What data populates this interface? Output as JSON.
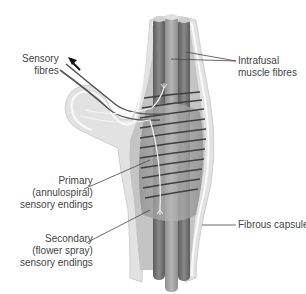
{
  "diagram": {
    "colors": {
      "capsule_outer": "#e2e2e2",
      "capsule_outline": "#f8f8f8",
      "capsule_inner": "#bdbdbd",
      "fibre_dark": "#6a6a6a",
      "fibre_mid": "#8c8c8c",
      "fibre_light": "#a4a4a4",
      "spiral": "#3f3f3f",
      "nerve": "#555555",
      "leader": "#444444",
      "text": "#444444"
    }
  },
  "labels": {
    "sensory_fibres": [
      "Sensory",
      "fibres"
    ],
    "intrafusal": [
      "Intrafusal",
      "muscle fibres"
    ],
    "primary": [
      "Primary",
      "(annulospiral)",
      "sensory endings"
    ],
    "secondary": [
      "Secondary",
      "(flower spray)",
      "sensory endings"
    ],
    "capsule": [
      "Fibrous capsule"
    ]
  },
  "arrow": {
    "direction": "up-left",
    "meaning": "afferent signal direction"
  }
}
